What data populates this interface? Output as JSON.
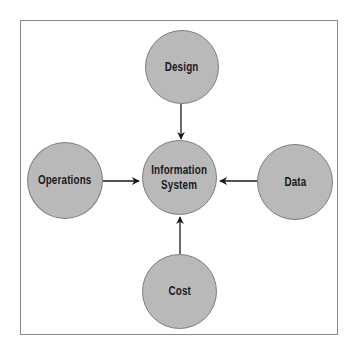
{
  "diagram": {
    "center": {
      "label": "Information\nSystem"
    },
    "nodes": {
      "top": {
        "label": "Design"
      },
      "left": {
        "label": "Operations"
      },
      "right": {
        "label": "Data"
      },
      "bottom": {
        "label": "Cost"
      }
    },
    "edges": [
      {
        "from": "Design",
        "to": "Information System"
      },
      {
        "from": "Operations",
        "to": "Information System"
      },
      {
        "from": "Data",
        "to": "Information System"
      },
      {
        "from": "Cost",
        "to": "Information System"
      }
    ],
    "colors": {
      "node_fill": "#b9b9b9",
      "node_border": "#7e7e7e",
      "frame_border": "#8a8a8a",
      "arrow": "#1a1a1a"
    }
  }
}
